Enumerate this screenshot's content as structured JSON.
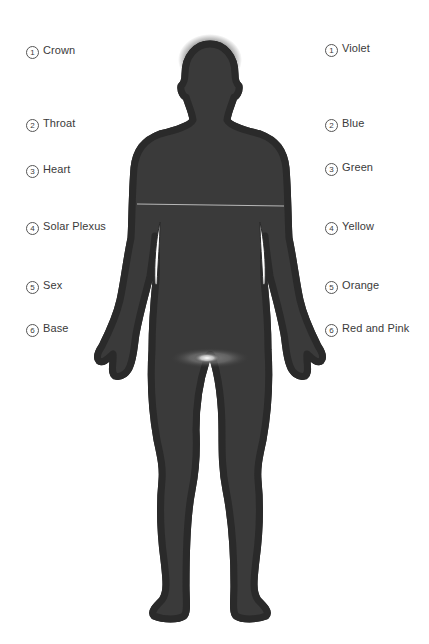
{
  "diagram": {
    "title": "",
    "left_labels": [
      {
        "num": "1",
        "text": "Crown"
      },
      {
        "num": "2",
        "text": "Throat"
      },
      {
        "num": "3",
        "text": "Heart"
      },
      {
        "num": "4",
        "text": "Solar Plexus"
      },
      {
        "num": "5",
        "text": "Sex"
      },
      {
        "num": "6",
        "text": "Base"
      }
    ],
    "right_labels": [
      {
        "num": "1",
        "text": "Violet"
      },
      {
        "num": "2",
        "text": "Blue"
      },
      {
        "num": "3",
        "text": "Green"
      },
      {
        "num": "4",
        "text": "Yellow"
      },
      {
        "num": "5",
        "text": "Orange"
      },
      {
        "num": "6",
        "text": "Red and Pink"
      }
    ],
    "figure": {
      "subject": "human-body-silhouette",
      "colors": {
        "head": "#1a1a1a",
        "upper_torso": "#8a8a8a",
        "solar_plexus_band": "#f0f0f0",
        "lower_body": "#3c3c3c",
        "outline": "#ffffff",
        "outer_edge": "#2a2a2a",
        "base_glow": "#ffffff"
      }
    }
  }
}
